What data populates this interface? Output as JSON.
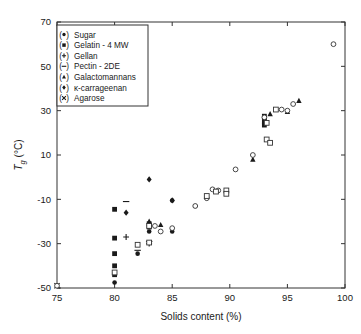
{
  "chart_data": {
    "type": "scatter",
    "title": "",
    "xlabel": "Solids content (%)",
    "ylabel": "Tg (°C)",
    "ylabel_base": "T",
    "ylabel_sub": "g",
    "ylabel_unit": " (°C)",
    "xlim": [
      75,
      100
    ],
    "ylim": [
      -50,
      70
    ],
    "xticks": [
      75,
      80,
      85,
      90,
      95,
      100
    ],
    "yticks": [
      -50,
      -30,
      -10,
      10,
      30,
      50,
      70
    ],
    "xtick_labels": [
      "75",
      "80",
      "85",
      "90",
      "95",
      "100"
    ],
    "ytick_labels": [
      "-50",
      "-30",
      "-10",
      "10",
      "30",
      "50",
      "70"
    ],
    "grid": false,
    "legend_position": "top-left",
    "legend": [
      {
        "marker": "filled-circle",
        "label": "Sugar"
      },
      {
        "marker": "filled-square",
        "label": "Gelatin - 4 MW"
      },
      {
        "marker": "plus",
        "label": "Gellan"
      },
      {
        "marker": "minus",
        "label": "Pectin - 2DE"
      },
      {
        "marker": "filled-triangle",
        "label": "Galactomannans"
      },
      {
        "marker": "filled-diamond",
        "label": "κ-carrageenan"
      },
      {
        "marker": "cross",
        "label": "Agarose"
      }
    ],
    "series": [
      {
        "name": "Sugar",
        "marker": "filled-circle",
        "points": [
          [
            80.0,
            -47.5
          ],
          [
            82.0,
            -34.5
          ],
          [
            83.0,
            -24.5
          ],
          [
            85.0,
            -24.5
          ],
          [
            85.0,
            -10.5
          ],
          [
            87.0,
            -13.0
          ],
          [
            93.0,
            27.0
          ],
          [
            93.0,
            26.0
          ]
        ]
      },
      {
        "name": "Gelatin - 4 MW",
        "marker": "filled-square",
        "points": [
          [
            80.0,
            -14.5
          ],
          [
            80.0,
            -27.5
          ],
          [
            80.0,
            -34.5
          ],
          [
            80.0,
            -40.0
          ],
          [
            80.0,
            -44.0
          ],
          [
            83.0,
            -21.0
          ],
          [
            83.0,
            -22.5
          ],
          [
            93.0,
            25.0
          ],
          [
            93.0,
            23.5
          ],
          [
            93.0,
            27.5
          ]
        ]
      },
      {
        "name": "Gellan",
        "marker": "plus",
        "points": [
          [
            81.0,
            -27.0
          ],
          [
            83.0,
            -30.0
          ]
        ]
      },
      {
        "name": "Pectin - 2DE",
        "marker": "minus",
        "points": [
          [
            81.0,
            -11.0
          ],
          [
            82.0,
            -33.0
          ],
          [
            83.0,
            -29.0
          ]
        ]
      },
      {
        "name": "Galactomannans",
        "marker": "filled-triangle",
        "points": [
          [
            83.0,
            -20.0
          ],
          [
            84.0,
            -21.5
          ],
          [
            92.0,
            8.0
          ],
          [
            93.5,
            28.5
          ],
          [
            96.0,
            34.5
          ],
          [
            95.0,
            29.5
          ]
        ]
      },
      {
        "name": "κ-carrageenan",
        "marker": "filled-diamond",
        "points": [
          [
            81.0,
            -16.0
          ],
          [
            83.0,
            -1.0
          ],
          [
            85.0,
            -10.5
          ],
          [
            93.0,
            26.5
          ]
        ]
      },
      {
        "name": "Agarose",
        "marker": "cross",
        "points": [
          [
            75.0,
            -49.0
          ]
        ]
      },
      {
        "name": "open-circle-series",
        "marker": "open-circle",
        "points": [
          [
            75.0,
            -49.0
          ],
          [
            83.5,
            -22.0
          ],
          [
            84.0,
            -24.5
          ],
          [
            85.0,
            -23.0
          ],
          [
            87.0,
            -13.0
          ],
          [
            88.0,
            -9.5
          ],
          [
            88.5,
            -5.5
          ],
          [
            89.0,
            -6.0
          ],
          [
            90.5,
            3.5
          ],
          [
            92.0,
            10.0
          ],
          [
            93.0,
            27.0
          ],
          [
            94.5,
            30.5
          ],
          [
            95.5,
            33.0
          ],
          [
            95.0,
            30.0
          ],
          [
            99.0,
            60.0
          ]
        ]
      },
      {
        "name": "open-square-series",
        "marker": "open-square",
        "points": [
          [
            80.0,
            -43.0
          ],
          [
            82.0,
            -30.5
          ],
          [
            83.0,
            -22.0
          ],
          [
            83.0,
            -29.5
          ],
          [
            88.0,
            -8.5
          ],
          [
            88.8,
            -6.5
          ],
          [
            89.7,
            -6.0
          ],
          [
            89.7,
            -7.5
          ],
          [
            93.2,
            17.0
          ],
          [
            93.5,
            15.5
          ],
          [
            93.2,
            24.5
          ],
          [
            94.0,
            30.5
          ]
        ]
      }
    ]
  }
}
